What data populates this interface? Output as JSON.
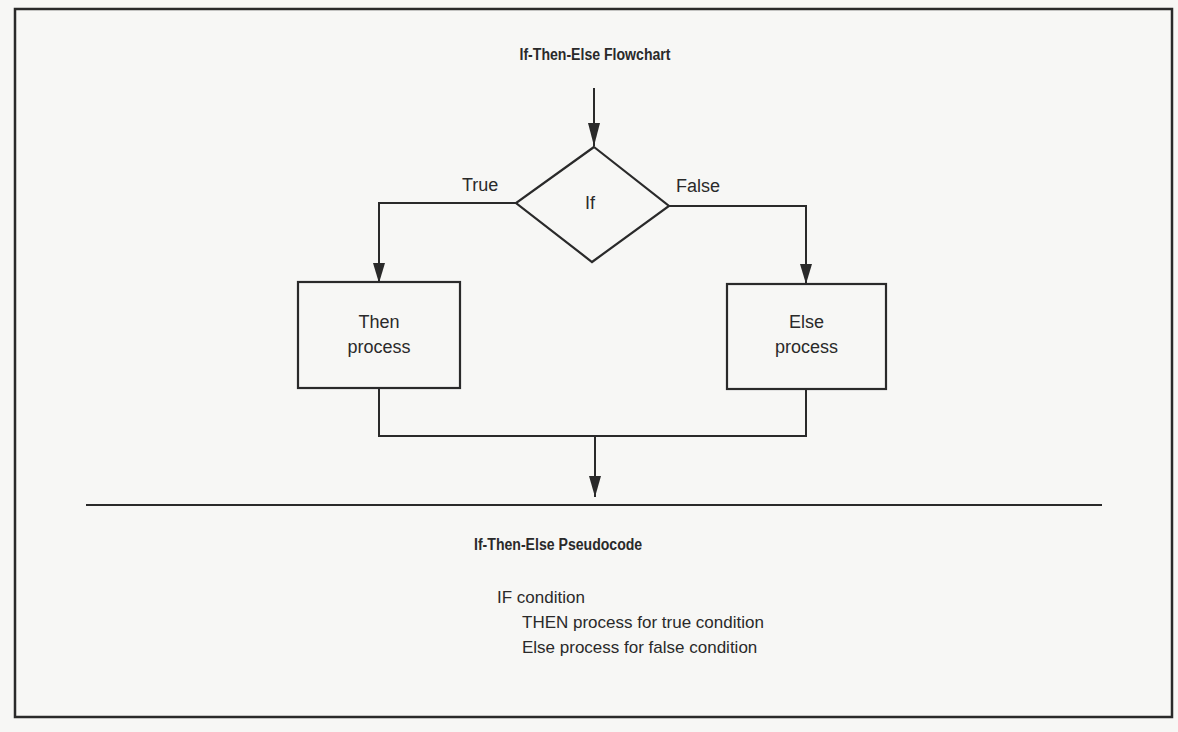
{
  "diagram": {
    "flowchart_title": "If-Then-Else Flowchart",
    "decision": {
      "label": "If"
    },
    "branches": {
      "true_label": "True",
      "false_label": "False"
    },
    "then_box": {
      "line1": "Then",
      "line2": "process"
    },
    "else_box": {
      "line1": "Else",
      "line2": "process"
    },
    "pseudocode_title": "If-Then-Else Pseudocode",
    "pseudocode": [
      "IF condition",
      "THEN process for true condition",
      "Else process for false condition"
    ],
    "colors": {
      "stroke": "#2a2a2a",
      "background": "#f7f7f5"
    }
  }
}
